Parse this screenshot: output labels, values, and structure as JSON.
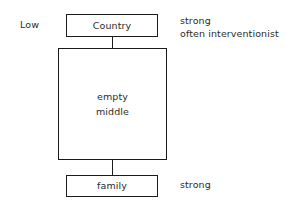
{
  "diagram": {
    "background_color": "#ffffff",
    "stroke_color": "#1b1b1b",
    "text_color": "#2b2b2b",
    "nodes": [
      {
        "id": "country",
        "label": "Country"
      },
      {
        "id": "middle",
        "label_line1": "empty",
        "label_line2": "middle"
      },
      {
        "id": "family",
        "label": "family"
      }
    ],
    "left_labels": [
      {
        "id": "low",
        "text": "Low"
      }
    ],
    "right_notes": [
      {
        "id": "top",
        "line1": "strong",
        "line2": "often interventionist"
      },
      {
        "id": "bottom",
        "line1": "strong"
      }
    ]
  }
}
